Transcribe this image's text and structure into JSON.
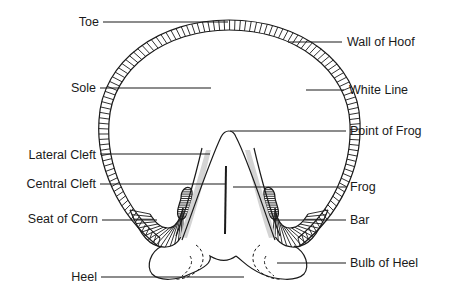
{
  "diagram": {
    "labels": {
      "left": [
        {
          "id": "toe",
          "text": "Toe"
        },
        {
          "id": "sole",
          "text": "Sole"
        },
        {
          "id": "lateral_cleft",
          "text": "Lateral Cleft"
        },
        {
          "id": "central_cleft",
          "text": "Central Cleft"
        },
        {
          "id": "seat_of_corn",
          "text": "Seat of Corn"
        },
        {
          "id": "heel",
          "text": "Heel"
        }
      ],
      "right": [
        {
          "id": "wall_of_hoof",
          "text": "Wall of Hoof"
        },
        {
          "id": "white_line",
          "text": "White Line"
        },
        {
          "id": "point_of_frog",
          "text": "Point of Frog"
        },
        {
          "id": "frog",
          "text": "Frog"
        },
        {
          "id": "bar",
          "text": "Bar"
        },
        {
          "id": "bulb_of_heel",
          "text": "Bulb of Heel"
        }
      ]
    },
    "colors": {
      "ink": "#1a1a1a",
      "shading": "#d4d4d4",
      "background": "#ffffff"
    }
  }
}
